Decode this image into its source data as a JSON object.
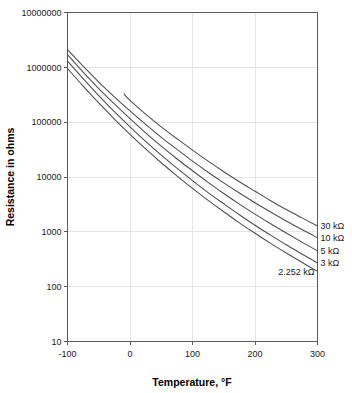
{
  "chart_data": {
    "type": "line",
    "title": "",
    "xlabel": "Temperature, °F",
    "ylabel": "Resistance in ohms",
    "xlim": [
      -100,
      300
    ],
    "ylim": [
      10,
      10000000
    ],
    "yscale": "log",
    "xscale": "linear",
    "grid": true,
    "legend_position": "right-inline-labels",
    "x_ticks": [
      -100,
      0,
      100,
      200,
      300
    ],
    "x_tick_labels": [
      "-100",
      "0",
      "100",
      "200",
      "300"
    ],
    "y_ticks": [
      10,
      100,
      1000,
      10000,
      100000,
      1000000,
      10000000
    ],
    "y_tick_labels": [
      "10",
      "100",
      "1000",
      "10000",
      "100000",
      "1000000",
      "10000000"
    ],
    "series": [
      {
        "name": "30 kΩ",
        "label": "30 kΩ",
        "x": [
          -10,
          0,
          25,
          50,
          75,
          100,
          125,
          150,
          175,
          200,
          225,
          250,
          275,
          300
        ],
        "values": [
          330000,
          250000,
          140000,
          82000,
          50000,
          31000,
          19500,
          12500,
          8200,
          5500,
          3700,
          2550,
          1800,
          1280
        ]
      },
      {
        "name": "10 kΩ",
        "label": "10 kΩ",
        "x": [
          -100,
          -75,
          -50,
          -25,
          0,
          25,
          50,
          75,
          100,
          125,
          150,
          175,
          200,
          225,
          250,
          275,
          300
        ],
        "values": [
          2100000,
          1050000,
          540000,
          290000,
          160000,
          91000,
          53000,
          32000,
          19500,
          12200,
          7800,
          5100,
          3400,
          2300,
          1580,
          1100,
          780
        ]
      },
      {
        "name": "5 kΩ",
        "label": "5 kΩ",
        "x": [
          -100,
          -75,
          -50,
          -25,
          0,
          25,
          50,
          75,
          100,
          125,
          150,
          175,
          200,
          225,
          250,
          275,
          300
        ],
        "values": [
          1700000,
          820000,
          410000,
          215000,
          116000,
          64000,
          36500,
          21500,
          13000,
          8000,
          5000,
          3200,
          2100,
          1400,
          950,
          650,
          450
        ]
      },
      {
        "name": "3 kΩ",
        "label": "3 kΩ",
        "x": [
          -100,
          -75,
          -50,
          -25,
          0,
          25,
          50,
          75,
          100,
          125,
          150,
          175,
          200,
          225,
          250,
          275,
          300
        ],
        "values": [
          1300000,
          620000,
          305000,
          155000,
          82000,
          44500,
          25000,
          14500,
          8600,
          5200,
          3250,
          2050,
          1320,
          870,
          580,
          395,
          270
        ]
      },
      {
        "name": "2.252 kΩ",
        "label": "2.252 kΩ",
        "x": [
          -100,
          -75,
          -50,
          -25,
          0,
          25,
          50,
          75,
          100,
          125,
          150,
          175,
          200,
          225,
          250,
          275,
          300
        ],
        "values": [
          950000,
          455000,
          224000,
          114000,
          60000,
          32500,
          18200,
          10500,
          6200,
          3750,
          2320,
          1460,
          940,
          615,
          410,
          278,
          190
        ]
      }
    ]
  },
  "axes": {
    "x_title": "Temperature, °F",
    "y_title": "Resistance in ohms"
  },
  "colors": {
    "curve": "#4d4d4d",
    "axis": "#5a5a5a",
    "grid": "#dedede",
    "text": "#1a1a1a",
    "background": "#ffffff"
  }
}
